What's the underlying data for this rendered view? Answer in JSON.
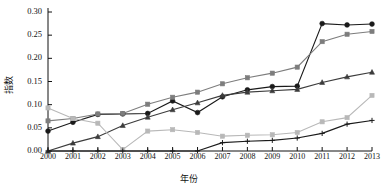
{
  "chart_data": {
    "type": "line",
    "title": "",
    "xlabel": "年份",
    "ylabel": "指数",
    "categories": [
      2000,
      2001,
      2002,
      2003,
      2004,
      2005,
      2006,
      2007,
      2008,
      2009,
      2010,
      2011,
      2012,
      2013
    ],
    "x_tick_labels": [
      "2000",
      "2001",
      "2002",
      "2003",
      "2004",
      "2005",
      "2006",
      "2007",
      "2008",
      "2009",
      "2010",
      "2011",
      "2012",
      "2013"
    ],
    "y_tick_labels": [
      "0.00",
      "0.05",
      "0.10",
      "0.15",
      "0.20",
      "0.25",
      "0.30"
    ],
    "y_ticks": [
      0.0,
      0.05,
      0.1,
      0.15,
      0.2,
      0.25,
      0.3
    ],
    "ylim": [
      0.0,
      0.3
    ],
    "xlim": [
      2000,
      2013
    ],
    "grid": false,
    "legend": "none",
    "series": [
      {
        "name": "series-1",
        "marker": "circle",
        "color": "#1a1a1a",
        "values": [
          0.043,
          0.062,
          0.079,
          0.08,
          0.081,
          0.108,
          0.083,
          0.117,
          0.132,
          0.139,
          0.14,
          0.275,
          0.272,
          0.274
        ]
      },
      {
        "name": "series-2",
        "marker": "square",
        "color": "#7d7d7d",
        "values": [
          0.065,
          0.07,
          0.08,
          0.081,
          0.101,
          0.116,
          0.127,
          0.145,
          0.158,
          0.168,
          0.181,
          0.236,
          0.252,
          0.258
        ]
      },
      {
        "name": "series-3",
        "marker": "triangle",
        "color": "#3c3c3c",
        "values": [
          0.0,
          0.017,
          0.031,
          0.055,
          0.073,
          0.089,
          0.104,
          0.12,
          0.127,
          0.13,
          0.133,
          0.148,
          0.16,
          0.17
        ]
      },
      {
        "name": "series-4",
        "marker": "square",
        "color": "#b8b8b8",
        "values": [
          0.093,
          0.07,
          0.06,
          0.003,
          0.043,
          0.046,
          0.04,
          0.032,
          0.034,
          0.035,
          0.04,
          0.063,
          0.072,
          0.12
        ]
      },
      {
        "name": "series-5",
        "marker": "plus",
        "color": "#1a1a1a",
        "values": [
          0.0,
          0.0,
          0.0,
          0.0,
          0.0,
          0.0,
          0.0,
          0.018,
          0.021,
          0.023,
          0.028,
          0.038,
          0.058,
          0.066
        ]
      }
    ]
  }
}
